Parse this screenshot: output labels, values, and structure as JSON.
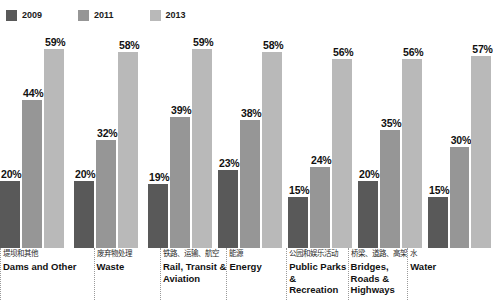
{
  "legend": {
    "items": [
      {
        "label": "2009",
        "color": "#595959",
        "swatch_name": "legend-swatch-2009"
      },
      {
        "label": "2011",
        "color": "#969696",
        "swatch_name": "legend-swatch-2011"
      },
      {
        "label": "2013",
        "color": "#b9b9b9",
        "swatch_name": "legend-swatch-2013"
      }
    ]
  },
  "chart_data": {
    "type": "bar",
    "title": "",
    "xlabel": "",
    "ylabel": "",
    "ylim": [
      0,
      62
    ],
    "grid": false,
    "legend_position": "top-left",
    "categories": [
      "Dams and Other",
      "Waste",
      "Rail, Transit & Aviation",
      "Energy",
      "Public Parks & Recreation",
      "Bridges, Roads & Highways",
      "Water"
    ],
    "categories_cn": [
      "堤坝和其他",
      "废弃物处理",
      "铁路、运输、航空",
      "能源",
      "公园和娱乐活动",
      "桥梁、道路、高架",
      "水"
    ],
    "series": [
      {
        "name": "2009",
        "color": "#595959",
        "values": [
          20,
          20,
          19,
          23,
          15,
          20,
          15
        ],
        "labels": [
          "20%",
          "20%",
          "19%",
          "23%",
          "15%",
          "20%",
          "15%"
        ]
      },
      {
        "name": "2011",
        "color": "#969696",
        "values": [
          44,
          32,
          39,
          38,
          24,
          35,
          30
        ],
        "labels": [
          "44%",
          "32%",
          "39%",
          "38%",
          "24%",
          "35%",
          "30%"
        ]
      },
      {
        "name": "2013",
        "color": "#b9b9b9",
        "values": [
          59,
          58,
          59,
          58,
          56,
          56,
          57
        ],
        "labels": [
          "59%",
          "58%",
          "59%",
          "58%",
          "56%",
          "56%",
          "57%"
        ]
      }
    ]
  }
}
